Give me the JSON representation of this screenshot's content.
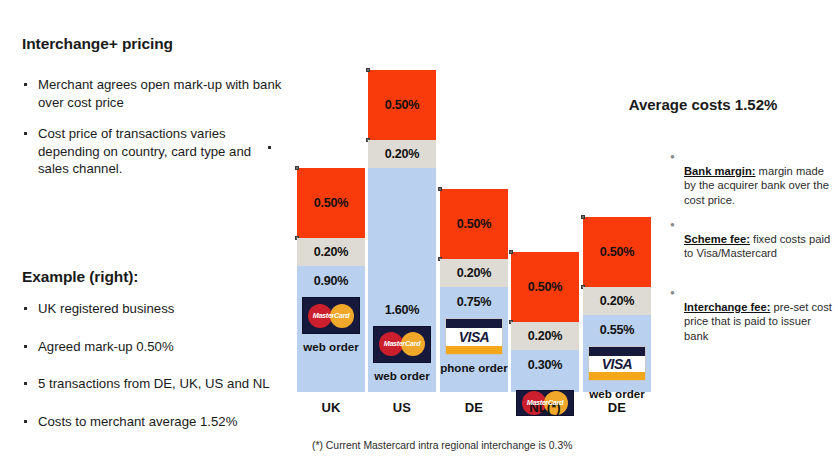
{
  "left": {
    "heading_pricing": "Interchange+ pricing",
    "bullets_pricing": [
      "Merchant agrees open mark-up with bank over cost price",
      "Cost price of transactions varies depending on country, card type and sales channel."
    ],
    "heading_example": "Example (right):",
    "bullets_example": [
      "UK registered business",
      "Agreed mark-up 0.50%",
      "5 transactions from DE, UK, US and NL",
      "Costs to merchant average 1.52%"
    ]
  },
  "right": {
    "average_costs": "Average costs 1.52%",
    "legend": [
      {
        "term": "Bank margin:",
        "text": " margin made by the acquirer bank over the cost price."
      },
      {
        "term": "Scheme fee:",
        "text": " fixed costs paid to Visa/Mastercard"
      },
      {
        "term": "Interchange fee:",
        "text": " pre-set cost price that is paid to issuer bank"
      }
    ]
  },
  "chart_data": {
    "type": "bar",
    "stacked": true,
    "xlabel": "",
    "ylabel": "",
    "ylim": [
      0,
      2.3
    ],
    "grid": false,
    "legend_position": "right",
    "categories": [
      "UK",
      "US",
      "DE",
      "NL(*)",
      "DE"
    ],
    "series": [
      {
        "name": "Interchange fee",
        "color": "#B9D0EE",
        "values": [
          0.9,
          1.6,
          0.75,
          0.3,
          0.55
        ]
      },
      {
        "name": "Scheme fee",
        "color": "#DEDBD4",
        "values": [
          0.2,
          0.2,
          0.2,
          0.2,
          0.2
        ]
      },
      {
        "name": "Bank margin",
        "color": "#F93B0C",
        "values": [
          0.5,
          0.5,
          0.5,
          0.5,
          0.5
        ]
      }
    ],
    "totals": [
      1.6,
      2.3,
      1.45,
      1.0,
      1.25
    ],
    "bars": [
      {
        "country": "UK",
        "card": "MasterCard",
        "channel": "web order",
        "interchange": "0.90%",
        "scheme": "0.20%",
        "margin": "0.50%"
      },
      {
        "country": "US",
        "card": "MasterCard",
        "channel": "web order",
        "interchange": "1.60%",
        "scheme": "0.20%",
        "margin": "0.50%"
      },
      {
        "country": "DE",
        "card": "VISA",
        "channel": "phone order",
        "interchange": "0.75%",
        "scheme": "0.20%",
        "margin": "0.50%"
      },
      {
        "country": "NL(*)",
        "card": "MasterCard",
        "channel": "",
        "interchange": "0.30%",
        "scheme": "0.20%",
        "margin": "0.50%"
      },
      {
        "country": "DE",
        "card": "VISA",
        "channel": "web order",
        "interchange": "0.55%",
        "scheme": "0.20%",
        "margin": "0.50%"
      }
    ],
    "annotations": [
      "(*) Current Mastercard intra regional interchange is 0.3%"
    ]
  },
  "footnote": "(*) Current Mastercard intra regional interchange is 0.3%",
  "logos": {
    "mastercard": "MasterCard",
    "visa": "VISA"
  },
  "colors": {
    "margin": "#F93B0C",
    "scheme": "#DEDBD4",
    "interchange": "#B9D0EE"
  }
}
